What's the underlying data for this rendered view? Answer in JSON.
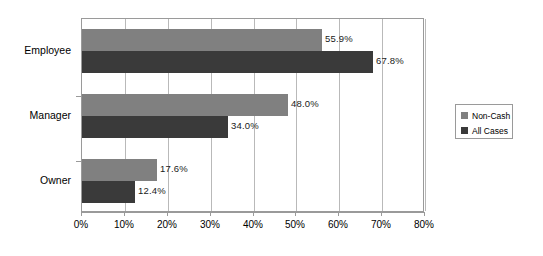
{
  "chart_data": {
    "type": "bar",
    "orientation": "horizontal",
    "title": "",
    "xlabel": "",
    "ylabel": "",
    "categories": [
      "Employee",
      "Manager",
      "Owner"
    ],
    "series": [
      {
        "name": "Non-Cash",
        "color": "#808080",
        "values": [
          55.9,
          48.0,
          17.6
        ],
        "labels": [
          "55.9%",
          "48.0%",
          "17.6%"
        ]
      },
      {
        "name": "All Cases",
        "color": "#3a3a3a",
        "values": [
          67.8,
          34.0,
          12.4
        ],
        "labels": [
          "67.8%",
          "34.0%",
          "12.4%"
        ]
      }
    ],
    "xlim": [
      0,
      80
    ],
    "xticks": [
      0,
      10,
      20,
      30,
      40,
      50,
      60,
      70,
      80
    ],
    "xtick_labels": [
      "0%",
      "10%",
      "20%",
      "30%",
      "40%",
      "50%",
      "60%",
      "70%",
      "80%"
    ],
    "grid": true,
    "grid_axis": "x",
    "legend_position": "right",
    "plot_border": true,
    "value_labels_shown": true
  },
  "legend": {
    "items": [
      {
        "label": "Non-Cash",
        "swatch": "legend-swatch-non-cash"
      },
      {
        "label": "All Cases",
        "swatch": "legend-swatch-all-cases"
      }
    ]
  },
  "colors": {
    "series_non_cash": "#808080",
    "series_all_cases": "#3a3a3a",
    "gridline": "#b9b9b9",
    "axis": "#9a9a9a",
    "background": "#ffffff",
    "text": "#000000"
  }
}
